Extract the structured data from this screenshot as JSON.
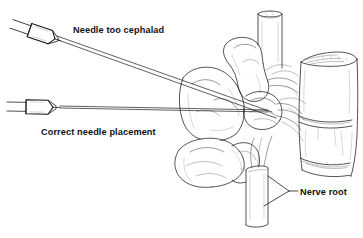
{
  "figure": {
    "background_color": "#ffffff",
    "ink_color": "#1b1b1b",
    "width": 363,
    "height": 238
  },
  "annotations": {
    "needle_too_cephalad": {
      "label": "Needle too cephalad",
      "x": 73,
      "y": 33
    },
    "correct_needle_placement": {
      "label": "Correct needle placement",
      "x": 41,
      "y": 135
    },
    "nerve_root": {
      "label": "Nerve root",
      "x": 300,
      "y": 195
    }
  },
  "structures": {
    "vertebral_body": "vertebral-body",
    "spinal_cord_tube": "dural-sac-tube",
    "nerve_root_tube": "nerve-root-tube",
    "transverse_process": "transverse-process",
    "superior_articular_process": "superior-articular-process",
    "pedicle": "pedicle",
    "spinous_process": "spinous-process"
  },
  "instruments": {
    "upper_syringe": {
      "name": "syringe-cephalad",
      "angle_deg": 17
    },
    "lower_syringe": {
      "name": "syringe-correct",
      "angle_deg": 0
    }
  }
}
